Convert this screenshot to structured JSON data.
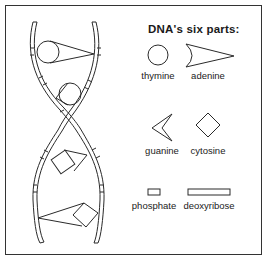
{
  "legend": {
    "title": "DNA's six parts:",
    "items": [
      {
        "name": "thymine",
        "shape": "circle"
      },
      {
        "name": "adenine",
        "shape": "concave-arrowhead"
      },
      {
        "name": "guanine",
        "shape": "notched-arrowhead"
      },
      {
        "name": "cytosine",
        "shape": "diamond"
      },
      {
        "name": "phosphate",
        "shape": "small-rectangle"
      },
      {
        "name": "deoxyribose",
        "shape": "long-rectangle"
      }
    ]
  },
  "diagram": {
    "base_pairs": [
      {
        "left": "thymine",
        "right": "adenine"
      },
      {
        "left": "adenine",
        "right": "thymine"
      },
      {
        "left": "cytosine",
        "right": "guanine"
      },
      {
        "left": "guanine",
        "right": "cytosine"
      }
    ],
    "line_color": "#2a2a2a"
  }
}
